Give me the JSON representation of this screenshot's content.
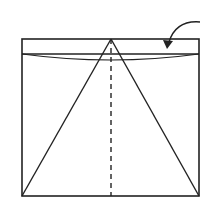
{
  "diagram": {
    "type": "origami-fold-step",
    "colors": {
      "stroke": "#222222",
      "background": "#ffffff"
    },
    "square": {
      "x": 22,
      "y": 39,
      "width": 177,
      "height": 157
    },
    "fold_line_y": 54,
    "apex": [
      111,
      39
    ],
    "arrow": {
      "direction": "fold-down",
      "from": [
        200,
        22
      ],
      "to": [
        167,
        48
      ]
    }
  }
}
